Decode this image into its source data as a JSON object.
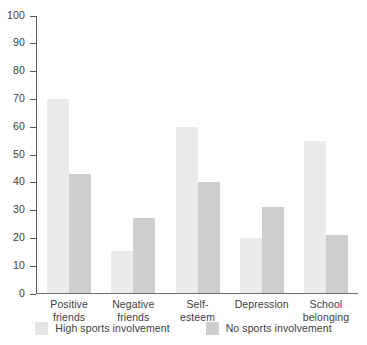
{
  "chart_data": {
    "type": "bar",
    "title": "",
    "subtitle": "",
    "xlabel": "",
    "ylabel": "",
    "ylim": [
      0,
      100
    ],
    "ytick_step": 10,
    "yticks": [
      100,
      90,
      80,
      70,
      60,
      50,
      40,
      30,
      20,
      10,
      0
    ],
    "grid": false,
    "legend_position": "bottom",
    "categories": [
      "Positive\nfriends",
      "Negative\nfriends",
      "Self-\nesteem",
      "Depression",
      "School\nbelonging"
    ],
    "series": [
      {
        "name": "High sports involvement",
        "color": "#ecebe9",
        "values": [
          70,
          15,
          60,
          20,
          55
        ]
      },
      {
        "name": "No sports involvement",
        "color": "#cfcecc",
        "values": [
          43,
          27,
          40,
          31,
          21
        ]
      }
    ]
  },
  "axis": {
    "tick_labels": [
      "100",
      "90",
      "80",
      "70",
      "60",
      "50",
      "40",
      "30",
      "20",
      "10",
      "0"
    ]
  },
  "categories_display": [
    {
      "line1": "Positive",
      "line2": "friends"
    },
    {
      "line1": "Negative",
      "line2": "friends"
    },
    {
      "line1": "Self-",
      "line2": "esteem"
    },
    {
      "line1": "Depression",
      "line2": ""
    },
    {
      "line1": "School",
      "line2": "belonging"
    }
  ],
  "legend": {
    "items": [
      {
        "label": "High sports involvement",
        "swatch": "legend-swatch-high"
      },
      {
        "label": "No sports involvement",
        "swatch": "legend-swatch-no"
      }
    ]
  },
  "colors": {
    "series_high": "#ecebe9",
    "series_no": "#cfcecc",
    "axis": "#595959",
    "text": "#3d3d3d",
    "background": "#ffffff"
  }
}
